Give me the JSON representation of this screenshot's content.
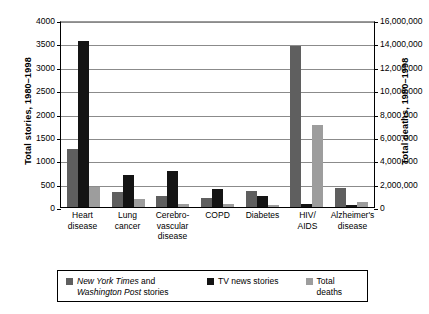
{
  "chart_data": {
    "type": "bar",
    "title": "",
    "categories": [
      "Heart disease",
      "Lung cancer",
      "Cerebro-vascular disease",
      "COPD",
      "Diabetes",
      "HIV/ AIDS",
      "Alzheimer's disease"
    ],
    "category_lines": [
      [
        "Heart",
        "disease"
      ],
      [
        "Lung",
        "cancer"
      ],
      [
        "Cerebro-",
        "vascular",
        "disease"
      ],
      [
        "COPD"
      ],
      [
        "Diabetes"
      ],
      [
        "HIV/",
        "AIDS"
      ],
      [
        "Alzheimer's",
        "disease"
      ]
    ],
    "series": [
      {
        "name": "New York Times and Washington Post stories",
        "axis": "left",
        "color": "#5f5f5f",
        "values": [
          1240,
          320,
          245,
          200,
          350,
          3450,
          410
        ]
      },
      {
        "name": "TV news stories",
        "axis": "left",
        "color": "#141414",
        "values": [
          3550,
          690,
          765,
          385,
          235,
          65,
          40
        ]
      },
      {
        "name": "Total deaths",
        "axis": "right",
        "color": "#9d9d9d",
        "values": [
          1720000,
          720000,
          300000,
          240000,
          160000,
          7000000,
          400000
        ]
      }
    ],
    "deaths_in_left_units": [
      430,
      180,
      75,
      60,
      40,
      1750,
      100
    ],
    "ylabel": "Total stories, 1980–1998",
    "ylabel_right": "Total deaths, 1980–1998",
    "xlabel": "",
    "ylim": [
      0,
      4000
    ],
    "ylim_right": [
      0,
      16000000
    ],
    "yticks": [
      "0",
      "500",
      "1000",
      "1500",
      "2000",
      "2500",
      "3000",
      "3500",
      "4000"
    ],
    "ytick_values": [
      0,
      500,
      1000,
      1500,
      2000,
      2500,
      3000,
      3500,
      4000
    ],
    "yticks_right": [
      "0",
      "2,000,000",
      "4,000,000",
      "6,000,000",
      "8,000,000",
      "10,000,000",
      "12,000,000",
      "14,000,000",
      "16,000,000"
    ],
    "ytick_values_right": [
      0,
      2000000,
      4000000,
      6000000,
      8000000,
      10000000,
      12000000,
      14000000,
      16000000
    ],
    "grid": true,
    "legend_position": "bottom"
  },
  "legend": {
    "item1_a": "New York Times",
    "item1_b": " and",
    "item1_c": "Washington Post",
    "item1_d": " stories",
    "item2": "TV news stories",
    "item3": "Total deaths"
  }
}
